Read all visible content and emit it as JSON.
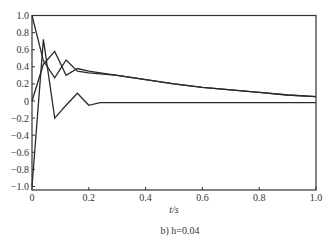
{
  "chart_data": {
    "type": "line",
    "title": "",
    "caption": "b) h=0.04",
    "xlabel": "t/s",
    "ylabel": "",
    "xlim": [
      0,
      1.0
    ],
    "ylim": [
      -1.0,
      1.0
    ],
    "grid": false,
    "legend": null,
    "xticks": [
      "0",
      "0.2",
      "0.4",
      "0.6",
      "0.8",
      "1.0"
    ],
    "xtick_values": [
      0,
      0.2,
      0.4,
      0.6,
      0.8,
      1.0
    ],
    "yticks": [
      "1.0",
      "0.8",
      "0.6",
      "0.4",
      "0.2",
      "0",
      "-0.2",
      "-0.4",
      "-0.6",
      "-0.8",
      "-1.0"
    ],
    "ytick_values": [
      1.0,
      0.8,
      0.6,
      0.4,
      0.2,
      0,
      -0.2,
      -0.4,
      -0.6,
      -0.8,
      -1.0
    ],
    "series": [
      {
        "name": "curve-1",
        "x": [
          0,
          0.04,
          0.08,
          0.12,
          0.16,
          0.2,
          0.3,
          0.4,
          0.5,
          0.6,
          0.7,
          0.8,
          0.9,
          1.0
        ],
        "values": [
          1.0,
          0.47,
          0.27,
          0.48,
          0.35,
          0.33,
          0.3,
          0.25,
          0.2,
          0.16,
          0.13,
          0.1,
          0.07,
          0.05
        ]
      },
      {
        "name": "curve-2",
        "x": [
          0,
          0.04,
          0.08,
          0.12,
          0.16,
          0.2,
          0.3,
          0.4,
          0.5,
          0.6,
          0.7,
          0.8,
          0.9,
          1.0
        ],
        "values": [
          0.0,
          0.43,
          0.58,
          0.3,
          0.38,
          0.35,
          0.3,
          0.25,
          0.2,
          0.16,
          0.13,
          0.1,
          0.07,
          0.05
        ]
      },
      {
        "name": "curve-3",
        "x": [
          0,
          0.04,
          0.08,
          0.12,
          0.16,
          0.2,
          0.24,
          0.3,
          0.4,
          0.5,
          0.6,
          0.7,
          0.8,
          0.9,
          1.0
        ],
        "values": [
          -1.0,
          0.72,
          -0.2,
          -0.05,
          0.09,
          -0.05,
          -0.02,
          -0.02,
          -0.02,
          -0.02,
          -0.02,
          -0.02,
          -0.02,
          -0.02,
          -0.02
        ]
      }
    ]
  },
  "colors": {
    "line": "#2a2a2a",
    "frame": "#333333",
    "text": "#333333",
    "background": "#ffffff"
  },
  "layout": {
    "plot_left": 32,
    "plot_right": 316,
    "plot_top": 15.5,
    "plot_bottom": 186.5,
    "frame_bottom": 190
  }
}
